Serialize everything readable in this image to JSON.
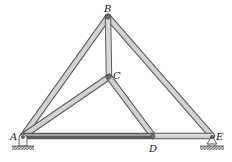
{
  "diagram": {
    "type": "truss",
    "joints": [
      {
        "id": "A",
        "label": "A",
        "x": 23,
        "y": 136,
        "support": "pin"
      },
      {
        "id": "B",
        "label": "B",
        "x": 108,
        "y": 17
      },
      {
        "id": "C",
        "label": "C",
        "x": 109,
        "y": 77
      },
      {
        "id": "D",
        "label": "D",
        "x": 153,
        "y": 136
      },
      {
        "id": "E",
        "label": "E",
        "x": 212,
        "y": 136,
        "support": "roller"
      }
    ],
    "members": [
      {
        "from": "A",
        "to": "B"
      },
      {
        "from": "B",
        "to": "E"
      },
      {
        "from": "B",
        "to": "C"
      },
      {
        "from": "A",
        "to": "C"
      },
      {
        "from": "C",
        "to": "D"
      },
      {
        "from": "A",
        "to": "D"
      },
      {
        "from": "D",
        "to": "E"
      }
    ],
    "labels": {
      "A": "A",
      "B": "B",
      "C": "C",
      "D": "D",
      "E": "E"
    },
    "colors": {
      "member_fill": "#cfcfcf",
      "member_edge": "#555555",
      "ground": "#9a9a9a"
    }
  }
}
